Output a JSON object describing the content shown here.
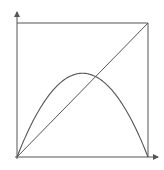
{
  "diagram": {
    "type": "logistic-map-graph",
    "colors": {
      "stroke": "#555555",
      "background": "#ffffff"
    },
    "axes": {
      "origin_px": [
        17,
        157
      ],
      "x_arrow_end_px": [
        158,
        157
      ],
      "y_arrow_end_px": [
        17,
        12
      ]
    },
    "box": {
      "left": 17,
      "top": 23,
      "right": 148,
      "bottom": 157
    },
    "curves": [
      {
        "name": "diagonal",
        "equation": "y = x"
      },
      {
        "name": "parabola",
        "equation": "y = r x (1 - x)",
        "r": 2.5
      }
    ]
  }
}
